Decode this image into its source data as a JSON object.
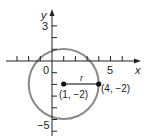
{
  "diagram": {
    "type": "circle-on-coordinate-plane",
    "axes": {
      "x_label": "x",
      "y_label": "y",
      "x_tick_labels": [
        {
          "value": 0,
          "text": "0"
        },
        {
          "value": 5,
          "text": "5"
        }
      ],
      "y_tick_labels": [
        {
          "value": 3,
          "text": "3"
        },
        {
          "value": -5,
          "text": "-5"
        }
      ],
      "x_range": [
        -4,
        7
      ],
      "y_range": [
        -6,
        4
      ]
    },
    "circle": {
      "center": [
        1,
        -2
      ],
      "radius": 3,
      "color": "#8a8a8a"
    },
    "points": [
      {
        "coords": [
          1,
          -2
        ],
        "label": "(1, −2)"
      },
      {
        "coords": [
          4,
          -2
        ],
        "label": "(4, −2)"
      }
    ],
    "radius_label": "r",
    "colors": {
      "axis": "#222222",
      "circle": "#8a8a8a",
      "points": "#111111"
    }
  }
}
